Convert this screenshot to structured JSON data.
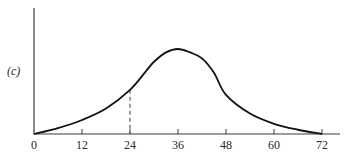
{
  "chart_data": {
    "type": "line",
    "title": "",
    "panel_label": "(c)",
    "xlabel": "",
    "ylabel": "",
    "xlim": [
      0,
      76
    ],
    "ylim": [
      0,
      1.45
    ],
    "grid": false,
    "legend": "none",
    "x_ticks": [
      0,
      12,
      24,
      36,
      48,
      60,
      72
    ],
    "x_tick_labels": [
      "0",
      "12",
      "24",
      "36",
      "48",
      "60",
      "72"
    ],
    "y_ticks": [],
    "series": [
      {
        "name": "curve",
        "style": "solid",
        "x": [
          0,
          6,
          12,
          18,
          24,
          28,
          30,
          33,
          36,
          39,
          42,
          45,
          48,
          54,
          60,
          66,
          72
        ],
        "y": [
          0.0,
          0.07,
          0.165,
          0.3,
          0.52,
          0.74,
          0.85,
          0.96,
          1.0,
          0.96,
          0.89,
          0.72,
          0.46,
          0.24,
          0.12,
          0.05,
          0.0
        ]
      }
    ],
    "annotations": [
      {
        "type": "dashed-vertical-line",
        "x": 24,
        "from_y": 0,
        "to_y": 0.52
      }
    ]
  }
}
